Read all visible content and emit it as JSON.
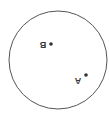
{
  "diagram": {
    "circle": {
      "cx": 58,
      "cy": 60,
      "r": 49,
      "stroke": "#555555"
    },
    "points": [
      {
        "name": "B",
        "x": 51,
        "y": 44,
        "label_x": 41,
        "label_y": 47
      },
      {
        "name": "A",
        "x": 86,
        "y": 75,
        "label_x": 77,
        "label_y": 81
      }
    ],
    "labels_rotated_deg": 180
  }
}
